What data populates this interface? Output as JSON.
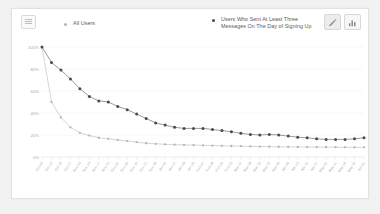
{
  "toolbar": {
    "menu_icon": "hamburger-icon",
    "edit_icon": "pencil-icon",
    "bar_chart_icon": "bar-chart-icon"
  },
  "legend": {
    "items": [
      {
        "label": "All Users",
        "color": "#b4b4b4",
        "marker": "dot"
      },
      {
        "label": "Users Who Sent At Least Three\nMessages On The Day of Signing Up",
        "color": "#4a4a4a",
        "marker": "dot"
      }
    ]
  },
  "chart_data": {
    "type": "line",
    "title": "",
    "xlabel": "",
    "ylabel": "",
    "ylim": [
      0,
      100
    ],
    "yticks": [
      0,
      20,
      40,
      60,
      80,
      100
    ],
    "ytick_labels": [
      "0%",
      "20%",
      "40%",
      "60%",
      "80%",
      "100%"
    ],
    "grid": true,
    "legend_position": "top",
    "categories": [
      "Oct 06",
      "Oct 13",
      "Oct 20",
      "Oct 27",
      "Nov 03",
      "Nov 10",
      "Nov 17",
      "Nov 24",
      "Dec 01",
      "Dec 08",
      "Dec 15",
      "Dec 22",
      "Dec 29",
      "Jan 05",
      "Jan 12",
      "Jan 19",
      "Jan 26",
      "Feb 02",
      "Feb 09",
      "Feb 16",
      "Feb 23",
      "Mar 02",
      "Mar 09",
      "Mar 16",
      "Mar 23",
      "Mar 30",
      "Apr 06",
      "Apr 13",
      "Apr 20",
      "Apr 27",
      "May 04",
      "May 11",
      "May 18",
      "May 25",
      "Jun 01"
    ],
    "series": [
      {
        "name": "All Users",
        "color": "#b4b4b4",
        "values": [
          100,
          50,
          36,
          27,
          22,
          19.5,
          17.5,
          16.5,
          15.5,
          14.5,
          13.5,
          12.5,
          12,
          11.5,
          11.2,
          11,
          10.8,
          10.6,
          10.4,
          10.2,
          10,
          9.8,
          9.6,
          9.5,
          9.4,
          9.3,
          9.2,
          9.1,
          9,
          9,
          8.9,
          8.9,
          8.8,
          8.8,
          8.8
        ]
      },
      {
        "name": "Users Who Sent At Least Three Messages On The Day of Signing Up",
        "color": "#4a4a4a",
        "values": [
          100,
          86,
          79,
          71,
          62,
          55,
          51,
          50,
          46,
          43,
          39,
          35,
          31,
          29,
          27,
          26,
          26,
          26,
          25,
          24,
          23,
          21.5,
          20.5,
          20,
          20.5,
          20,
          19,
          18,
          17.5,
          16.5,
          16,
          16,
          16,
          16.5,
          17.5
        ]
      }
    ]
  }
}
